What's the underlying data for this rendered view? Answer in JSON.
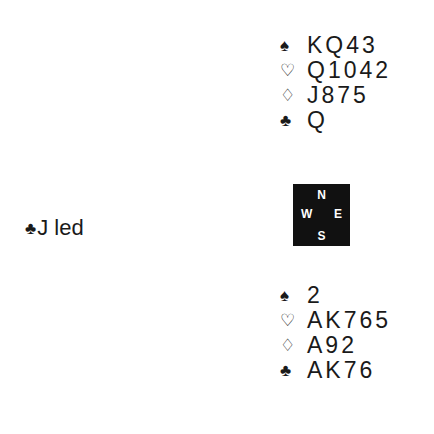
{
  "north": {
    "rows": [
      {
        "suit": "♠",
        "suit_name": "spade",
        "cards": "KQ43"
      },
      {
        "suit": "♡",
        "suit_name": "heart",
        "cards": "Q1042"
      },
      {
        "suit": "♢",
        "suit_name": "diamond",
        "cards": "J875"
      },
      {
        "suit": "♣",
        "suit_name": "club",
        "cards": "Q"
      }
    ]
  },
  "south": {
    "rows": [
      {
        "suit": "♠",
        "suit_name": "spade",
        "cards": "2"
      },
      {
        "suit": "♡",
        "suit_name": "heart",
        "cards": "AK765"
      },
      {
        "suit": "♢",
        "suit_name": "diamond",
        "cards": "A92"
      },
      {
        "suit": "♣",
        "suit_name": "club",
        "cards": "AK76"
      }
    ]
  },
  "compass": {
    "n": "N",
    "w": "W",
    "e": "E",
    "s": "S"
  },
  "lead": {
    "suit": "♣",
    "text": "J led"
  }
}
